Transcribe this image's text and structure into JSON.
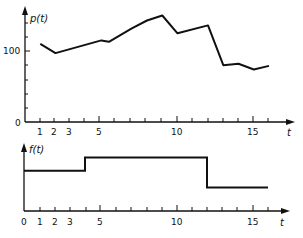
{
  "chart_data": [
    {
      "type": "line",
      "title": "",
      "ylabel": "p(t)",
      "xlabel": "t",
      "x": [
        1,
        2,
        5,
        5.5,
        7,
        8,
        9,
        10,
        12,
        13,
        14,
        15,
        16
      ],
      "values": [
        110,
        97,
        115,
        113,
        132,
        143,
        150,
        125,
        136,
        80,
        82,
        74,
        79
      ],
      "xlim": [
        0,
        17
      ],
      "ylim": [
        0,
        170
      ],
      "xticks": [
        1,
        2,
        3,
        4,
        5,
        6,
        7,
        8,
        9,
        10,
        11,
        12,
        13,
        14,
        15,
        16
      ],
      "xtick_labels": [
        "1",
        "2",
        "3",
        "5",
        "10",
        "15"
      ],
      "ytick_labels": [
        "0",
        "100"
      ],
      "grid": false,
      "legend": null
    },
    {
      "type": "line",
      "step": true,
      "title": "",
      "ylabel": "f(t)",
      "xlabel": "t",
      "x": [
        0,
        4,
        4,
        12,
        12,
        16
      ],
      "values": [
        0.6,
        0.6,
        0.8,
        0.8,
        0.35,
        0.35
      ],
      "segments": [
        {
          "from": 0,
          "to": 4,
          "level": "medium"
        },
        {
          "from": 4,
          "to": 12,
          "level": "high"
        },
        {
          "from": 12,
          "to": 16,
          "level": "low"
        }
      ],
      "xlim": [
        0,
        17
      ],
      "xticks": [
        1,
        2,
        3,
        4,
        5,
        6,
        7,
        8,
        9,
        10,
        11,
        12,
        13,
        14,
        15,
        16
      ],
      "xtick_labels": [
        "0",
        "1",
        "2",
        "3",
        "5",
        "10",
        "15"
      ],
      "grid": false,
      "legend": null
    }
  ],
  "top": {
    "ylabel": "p(t)",
    "xlabel": "t",
    "y0_label": "0",
    "y100_label": "100",
    "xtick_labels": [
      "1",
      "2",
      "3",
      "5",
      "10",
      "15"
    ]
  },
  "bottom": {
    "ylabel": "f(t)",
    "xlabel": "t",
    "xtick_labels": [
      "0",
      "1",
      "2",
      "3",
      "5",
      "10",
      "15"
    ]
  }
}
